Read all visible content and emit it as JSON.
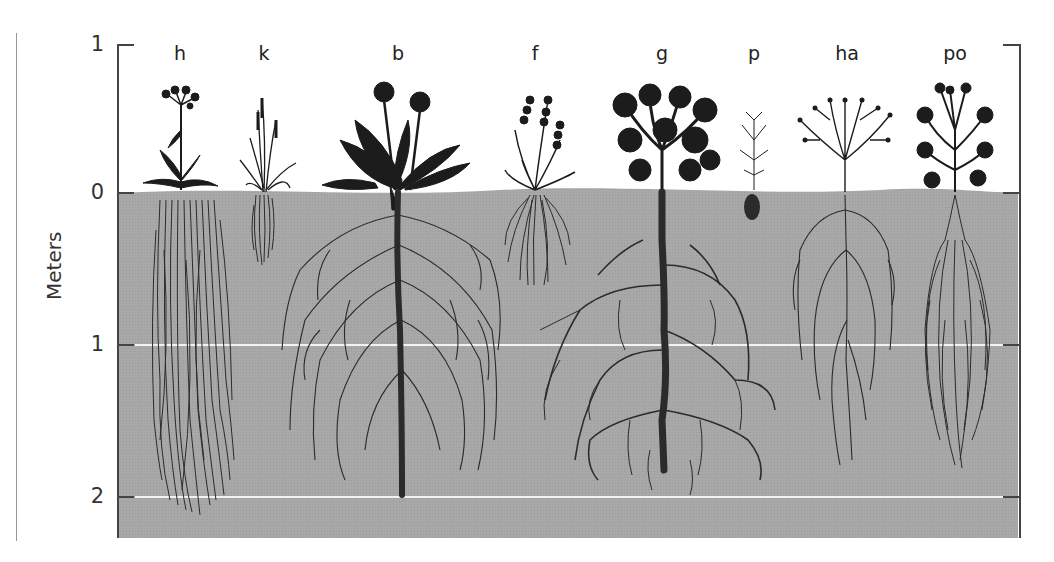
{
  "diagram": {
    "type": "plant-root-depth-illustration",
    "axis": {
      "title": "Meters",
      "ticks": [
        {
          "label": "1",
          "meaning": "1 m above ground",
          "y": 45
        },
        {
          "label": "0",
          "meaning": "ground level",
          "y": 193
        },
        {
          "label": "1",
          "meaning": "1 m below ground",
          "y": 345
        },
        {
          "label": "2",
          "meaning": "2 m below ground",
          "y": 497
        }
      ]
    },
    "colors": {
      "soil": "#a9a9a9",
      "plant": "#1c1c1c",
      "root": "#2b2b2b",
      "depth_line": "#f2f2f2",
      "axis": "#444444"
    },
    "species": [
      {
        "label": "h",
        "x": 180,
        "root_depth_m": 2.15,
        "root_form": "dense fibrous column"
      },
      {
        "label": "k",
        "x": 264,
        "root_depth_m": 0.45,
        "root_form": "small fibrous tuft"
      },
      {
        "label": "b",
        "x": 398,
        "root_depth_m": 2.0,
        "root_form": "taproot with wide lateral spread"
      },
      {
        "label": "f",
        "x": 535,
        "root_depth_m": 0.6,
        "root_form": "fibrous ball"
      },
      {
        "label": "g",
        "x": 662,
        "root_depth_m": 1.95,
        "root_form": "thick taproot with extensive branching"
      },
      {
        "label": "p",
        "x": 754,
        "root_depth_m": 0.2,
        "root_form": "tiny root tuft"
      },
      {
        "label": "ha",
        "x": 847,
        "root_depth_m": 1.8,
        "root_form": "branching lateral roots"
      },
      {
        "label": "po",
        "x": 955,
        "root_depth_m": 1.8,
        "root_form": "dense fibrous mass"
      }
    ]
  }
}
